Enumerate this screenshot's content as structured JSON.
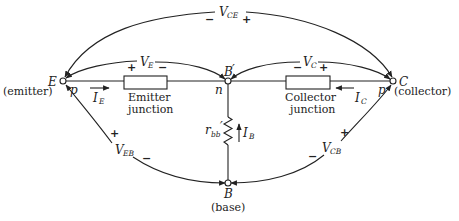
{
  "diagram": {
    "type": "transistor-junction-model",
    "nodes": {
      "emitter": {
        "letter": "E",
        "name": "(emitter)",
        "region": "p"
      },
      "base_internal": {
        "letter": "B",
        "prime": "′",
        "region": "n"
      },
      "collector": {
        "letter": "C",
        "name": "(collector)",
        "region": "p"
      },
      "base": {
        "letter": "B",
        "name": "(base)"
      }
    },
    "junctions": {
      "emitter": {
        "line1": "Emitter",
        "line2": "junction"
      },
      "collector": {
        "line1": "Collector",
        "line2": "junction"
      }
    },
    "resistor": {
      "symbol": "r",
      "subscript": "bb",
      "prime": "′"
    },
    "currents": {
      "emitter": {
        "symbol": "I",
        "subscript": "E"
      },
      "collector": {
        "symbol": "I",
        "subscript": "C"
      },
      "base": {
        "symbol": "I",
        "subscript": "B"
      }
    },
    "voltages": {
      "v_ce": {
        "symbol": "V",
        "subscript": "CE",
        "left_sign": "−",
        "right_sign": "+"
      },
      "v_e": {
        "symbol": "V",
        "subscript": "E",
        "left_sign": "+",
        "right_sign": "−"
      },
      "v_c": {
        "symbol": "V",
        "subscript": "C",
        "left_sign": "−",
        "right_sign": "+"
      },
      "v_eb": {
        "symbol": "V",
        "subscript": "EB",
        "top_sign": "+",
        "bottom_sign": "−"
      },
      "v_cb": {
        "symbol": "V",
        "subscript": "CB",
        "top_sign": "+",
        "bottom_sign": "−"
      }
    },
    "colors": {
      "ink": "#222222",
      "background": "#ffffff"
    }
  }
}
